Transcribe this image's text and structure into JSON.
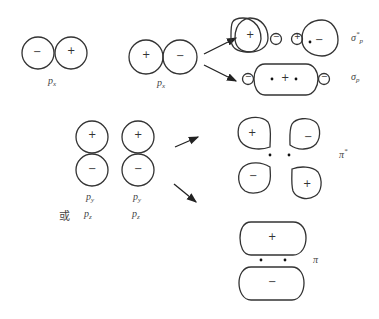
{
  "diagram": {
    "colors": {
      "stroke": "#333333",
      "background": "#ffffff",
      "text": "#444444"
    },
    "signs": {
      "plus": "+",
      "minus": "−"
    },
    "left_top": {
      "pair1_label": {
        "base": "p",
        "sub": "x"
      },
      "pair2_label": {
        "base": "p",
        "sub": "x"
      }
    },
    "left_bottom": {
      "col1_label": {
        "base": "p",
        "sub": "y"
      },
      "col2_label": {
        "base": "p",
        "sub": "y"
      },
      "or_text": "或",
      "col1_alt_label": {
        "base": "p",
        "sub": "z"
      },
      "col2_alt_label": {
        "base": "p",
        "sub": "z"
      }
    },
    "results": {
      "sigma_star": {
        "base": "σ",
        "sup": "*",
        "sub": "p"
      },
      "sigma": {
        "base": "σ",
        "sub": "p"
      },
      "pi_star": {
        "base": "π",
        "sup": "*"
      },
      "pi": {
        "base": "π"
      }
    },
    "arrows": [
      "to-sigma-star",
      "to-sigma",
      "to-pi-star",
      "to-pi"
    ]
  }
}
